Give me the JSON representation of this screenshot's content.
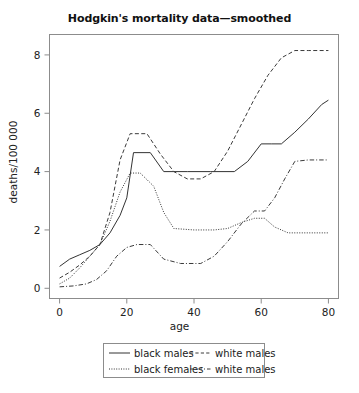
{
  "chart_data": {
    "type": "line",
    "title": "Hodgkin's mortality data—smoothed",
    "xlabel": "age",
    "ylabel": "deaths/100 000",
    "xlim": [
      -3,
      83
    ],
    "ylim": [
      -0.35,
      8.7
    ],
    "grid": false,
    "legend_position": "below-axes",
    "xticks": [
      0,
      20,
      40,
      60,
      80
    ],
    "xtick_labels": [
      "0",
      "20",
      "40",
      "60",
      "80"
    ],
    "yticks": [
      0,
      2,
      4,
      6,
      8
    ],
    "ytick_labels": [
      "0",
      "2",
      "4",
      "6",
      "8"
    ],
    "series": [
      {
        "name": "black males",
        "style": "solid",
        "color": "#333333",
        "x": [
          0,
          3,
          6,
          9,
          12,
          15,
          18,
          20,
          22,
          27,
          31,
          34,
          38,
          45,
          52,
          56,
          60,
          63,
          66,
          70,
          74,
          78,
          80
        ],
        "y": [
          0.75,
          1.0,
          1.15,
          1.3,
          1.5,
          1.9,
          2.5,
          3.1,
          4.65,
          4.65,
          4.0,
          4.0,
          4.0,
          4.0,
          4.0,
          4.35,
          4.95,
          4.95,
          4.95,
          5.35,
          5.8,
          6.3,
          6.45
        ]
      },
      {
        "name": "white males",
        "style": "dashed",
        "color": "#3a3a3a",
        "x": [
          0,
          3,
          6,
          9,
          12,
          15,
          18,
          21,
          26,
          30,
          34,
          38,
          42,
          46,
          50,
          54,
          58,
          62,
          66,
          70,
          74,
          80
        ],
        "y": [
          0.35,
          0.55,
          0.8,
          1.1,
          1.5,
          2.6,
          4.4,
          5.3,
          5.3,
          4.6,
          4.0,
          3.75,
          3.75,
          4.0,
          4.7,
          5.6,
          6.5,
          7.3,
          7.9,
          8.15,
          8.15,
          8.15
        ]
      },
      {
        "name": "black females",
        "style": "dotted",
        "color": "#333333",
        "x": [
          0,
          3,
          6,
          9,
          12,
          15,
          18,
          21,
          24,
          28,
          31,
          34,
          40,
          46,
          50,
          54,
          58,
          61,
          64,
          68,
          74,
          80
        ],
        "y": [
          0.15,
          0.35,
          0.7,
          1.1,
          1.5,
          2.3,
          3.3,
          3.95,
          3.95,
          3.5,
          2.6,
          2.05,
          2.0,
          2.0,
          2.05,
          2.25,
          2.4,
          2.4,
          2.1,
          1.9,
          1.9,
          1.9
        ]
      },
      {
        "name": "white males",
        "style": "dashdot",
        "color": "#3a3a3a",
        "x": [
          0,
          4,
          8,
          11,
          14,
          17,
          20,
          23,
          27,
          31,
          36,
          42,
          46,
          50,
          54,
          58,
          61,
          64,
          67,
          70,
          74,
          80
        ],
        "y": [
          0.05,
          0.08,
          0.15,
          0.3,
          0.6,
          1.1,
          1.4,
          1.5,
          1.5,
          1.0,
          0.85,
          0.85,
          1.1,
          1.6,
          2.2,
          2.65,
          2.65,
          3.1,
          3.75,
          4.35,
          4.4,
          4.4
        ]
      }
    ]
  },
  "legend": {
    "entries": [
      {
        "label": "black males",
        "style": "solid"
      },
      {
        "label": "white males",
        "style": "dashed"
      },
      {
        "label": "black females",
        "style": "dotted"
      },
      {
        "label": "white males",
        "style": "dashdot"
      }
    ]
  },
  "colors": {
    "axis": "#8c8c8c",
    "text": "#1a1a1a",
    "background": "#ffffff"
  }
}
